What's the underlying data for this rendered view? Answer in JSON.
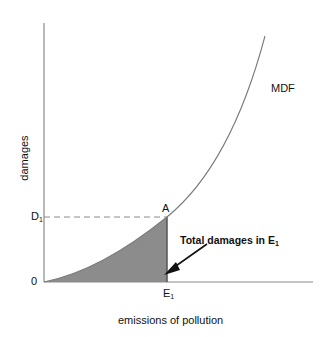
{
  "diagram": {
    "y_axis_label": "damages",
    "x_axis_label": "emissions of pollution",
    "curve_label": "MDF",
    "origin_label": "0",
    "point_label": "A",
    "y_tick": {
      "main": "D",
      "sub": "1"
    },
    "x_tick": {
      "main": "E",
      "sub": "1"
    },
    "annotation": {
      "main": "Total damages in E",
      "sub": "1"
    },
    "colors": {
      "axis": "#8a8a8a",
      "curve": "#7a7a7a",
      "shaded_area": "#8c8c8c",
      "arrow": "#111111",
      "dashed": "#8a8a8a"
    }
  }
}
